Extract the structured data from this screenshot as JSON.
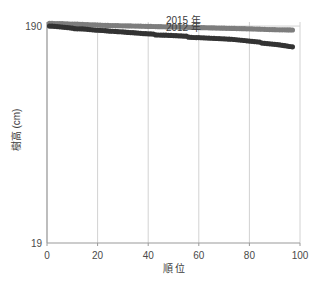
{
  "chart_data": {
    "type": "scatter",
    "title": "",
    "xlabel": "順 位",
    "ylabel": "樹高 (cm)",
    "xlim": [
      0,
      100
    ],
    "ylim": [
      19,
      193.2
    ],
    "xticks": [
      0,
      20,
      40,
      60,
      80,
      100
    ],
    "xticklabels": [
      "0",
      "20",
      "40",
      "60",
      "80",
      "100"
    ],
    "yticks": [
      19,
      190
    ],
    "yticklabels": [
      "19",
      "190"
    ],
    "grid": true,
    "grid_axis": "both",
    "legend": "inline-annotations",
    "annotations": [
      {
        "text": "2015 年",
        "x": 47,
        "y": 191.4
      },
      {
        "text": "2012 年",
        "x": 47,
        "y": 186.2
      }
    ],
    "colors": {
      "series_2015": "#7d7d7d",
      "series_2012": "#333333",
      "grid": "#d2d2d2",
      "axis": "#9a9a9a",
      "text": "#3c3c3c"
    },
    "series": [
      {
        "name": "2015 年",
        "color": "#7d7d7d",
        "x": [
          1,
          2,
          3,
          4,
          5,
          6,
          7,
          8,
          9,
          10,
          11,
          12,
          13,
          14,
          15,
          16,
          17,
          18,
          19,
          20,
          21,
          22,
          23,
          24,
          25,
          26,
          27,
          28,
          29,
          30,
          31,
          32,
          33,
          34,
          35,
          36,
          37,
          38,
          39,
          40,
          41,
          42,
          43,
          44,
          45,
          46,
          47,
          48,
          49,
          50,
          51,
          52,
          53,
          54,
          55,
          56,
          57,
          58,
          59,
          60,
          61,
          62,
          63,
          64,
          65,
          66,
          67,
          68,
          69,
          70,
          71,
          72,
          73,
          74,
          75,
          76,
          77,
          78,
          79,
          80,
          81,
          82,
          83,
          84,
          85,
          86,
          87,
          88,
          89,
          90,
          91,
          92,
          93,
          94,
          95,
          96,
          97
        ],
        "y": [
          192.2,
          192.1,
          192.0,
          191.95,
          191.9,
          191.85,
          191.8,
          191.7,
          191.6,
          191.55,
          191.5,
          191.45,
          191.4,
          191.3,
          191.2,
          191.1,
          191.0,
          190.95,
          190.9,
          190.8,
          190.7,
          190.6,
          190.55,
          190.5,
          190.45,
          190.4,
          190.35,
          190.3,
          190.25,
          190.2,
          190.15,
          190.1,
          190.1,
          190.05,
          190.0,
          189.95,
          189.9,
          189.85,
          189.8,
          189.75,
          189.7,
          189.65,
          189.6,
          189.55,
          189.5,
          189.45,
          189.4,
          189.35,
          189.3,
          189.3,
          189.25,
          189.2,
          189.15,
          189.1,
          189.05,
          189.0,
          188.95,
          188.9,
          188.85,
          188.8,
          188.75,
          188.7,
          188.65,
          188.6,
          188.55,
          188.5,
          188.45,
          188.4,
          188.35,
          188.3,
          188.25,
          188.2,
          188.15,
          188.1,
          188.05,
          188.0,
          187.95,
          187.9,
          187.85,
          187.8,
          187.75,
          187.7,
          187.6,
          187.55,
          187.5,
          187.4,
          187.3,
          187.25,
          187.2,
          187.15,
          187.1,
          187.05,
          187.0,
          187.0,
          186.95,
          186.95,
          186.9
        ]
      },
      {
        "name": "2012 年",
        "color": "#333333",
        "x": [
          1,
          2,
          3,
          4,
          5,
          6,
          7,
          8,
          9,
          10,
          11,
          12,
          13,
          14,
          15,
          16,
          17,
          18,
          19,
          20,
          21,
          22,
          23,
          24,
          25,
          26,
          27,
          28,
          29,
          30,
          31,
          32,
          33,
          34,
          35,
          36,
          37,
          38,
          39,
          40,
          41,
          42,
          43,
          44,
          45,
          46,
          47,
          48,
          49,
          50,
          51,
          52,
          53,
          54,
          55,
          56,
          57,
          58,
          59,
          60,
          61,
          62,
          63,
          64,
          65,
          66,
          67,
          68,
          69,
          70,
          71,
          72,
          73,
          74,
          75,
          76,
          77,
          78,
          79,
          80,
          81,
          82,
          83,
          84,
          85,
          86,
          87,
          88,
          89,
          90,
          91,
          92,
          93,
          94,
          95,
          96,
          97
        ],
        "y": [
          190.0,
          189.9,
          189.8,
          189.6,
          189.4,
          189.2,
          189.0,
          188.8,
          188.6,
          188.3,
          187.9,
          187.85,
          187.8,
          187.75,
          187.6,
          187.4,
          187.2,
          187.0,
          186.8,
          186.7,
          186.6,
          186.5,
          186.4,
          186.2,
          186.0,
          185.9,
          185.8,
          185.6,
          185.5,
          185.4,
          185.2,
          185.0,
          184.9,
          184.8,
          184.6,
          184.5,
          184.3,
          184.1,
          184.0,
          183.9,
          183.8,
          183.7,
          183.0,
          182.95,
          182.9,
          182.85,
          182.8,
          182.7,
          182.6,
          182.5,
          182.4,
          182.3,
          182.2,
          182.1,
          182.0,
          181.2,
          181.1,
          181.0,
          180.95,
          180.9,
          180.8,
          180.7,
          180.6,
          180.5,
          180.4,
          180.3,
          180.2,
          180.1,
          180.0,
          179.9,
          179.8,
          179.7,
          179.6,
          179.4,
          179.2,
          179.0,
          178.8,
          178.6,
          178.4,
          178.2,
          178.0,
          177.8,
          177.6,
          177.4,
          176.6,
          176.4,
          176.2,
          176.0,
          175.8,
          175.6,
          175.4,
          175.1,
          174.8,
          174.5,
          174.2,
          173.9,
          173.6
        ]
      }
    ]
  }
}
